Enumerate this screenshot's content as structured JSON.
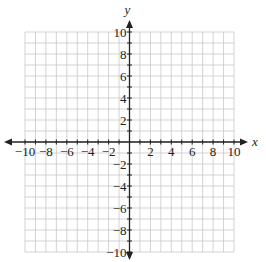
{
  "chart_data": {
    "type": "scatter",
    "title": "",
    "xlabel": "x",
    "ylabel": "y",
    "xlim": [
      -10,
      10
    ],
    "ylim": [
      -10,
      10
    ],
    "grid": true,
    "grid_step": 1,
    "x_ticks": [
      -10,
      -8,
      -6,
      -4,
      -2,
      2,
      4,
      6,
      8,
      10
    ],
    "x_tick_labels": [
      "−10",
      "−8",
      "−6",
      "−4",
      "−2",
      "2",
      "4",
      "6",
      "8",
      "10"
    ],
    "y_ticks": [
      10,
      8,
      6,
      4,
      2,
      -2,
      -4,
      -6,
      -8,
      -10
    ],
    "y_tick_labels": [
      "10",
      "8",
      "6",
      "4",
      "2",
      "−2",
      "−4",
      "−6",
      "−8",
      "−10"
    ],
    "series": []
  },
  "colors": {
    "grid": "#c8c8c8",
    "axis": "#222222",
    "text": "#222222"
  }
}
